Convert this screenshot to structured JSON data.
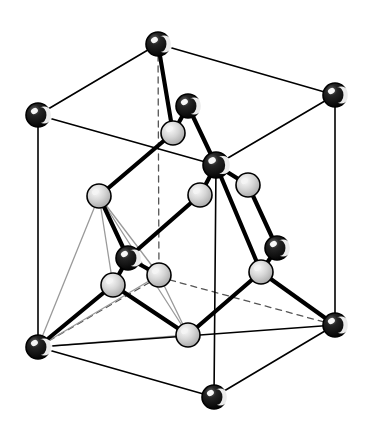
{
  "figure": {
    "background_color": "#ffffff",
    "width": 368,
    "height": 424
  },
  "style": {
    "cell_edge_color": "#000000",
    "cell_edge_width": 1.6,
    "hidden_edge_color": "#555555",
    "hidden_edge_width": 1.3,
    "hidden_edge_dash": "6 5",
    "bond_color": "#000000",
    "bond_width": 4.2,
    "thin_bond_color": "#9a9a9a",
    "thin_bond_width": 1.3,
    "atom_dark_fill": "#0a0a0a",
    "atom_dark_highlight": "#ffffff",
    "atom_light_fill": "#c9c9c9",
    "atom_light_highlight": "#f4f4f4",
    "atom_outline": "#000000",
    "atom_outline_width": 1.6
  },
  "cell_vertices": {
    "top_back": {
      "id": "A",
      "x": 158,
      "y": 44
    },
    "top_left": {
      "id": "B",
      "x": 38,
      "y": 115
    },
    "top_right": {
      "id": "C",
      "x": 335,
      "y": 95
    },
    "top_front": {
      "id": "D",
      "x": 216,
      "y": 165
    },
    "bot_back": {
      "id": "E",
      "x": 159,
      "y": 277
    },
    "bot_left": {
      "id": "F",
      "x": 38,
      "y": 347
    },
    "bot_right": {
      "id": "G",
      "x": 335,
      "y": 325
    },
    "bot_front": {
      "id": "H",
      "x": 214,
      "y": 397
    }
  },
  "cell_edges_visible": [
    {
      "name": "top-back-to-top-left",
      "from": "top_back",
      "to": "top_left"
    },
    {
      "name": "top-back-to-top-right",
      "from": "top_back",
      "to": "top_right"
    },
    {
      "name": "top-left-to-top-front",
      "from": "top_left",
      "to": "top_front"
    },
    {
      "name": "top-right-to-top-front",
      "from": "top_right",
      "to": "top_front"
    },
    {
      "name": "top-left-to-bot-left",
      "from": "top_left",
      "to": "bot_left"
    },
    {
      "name": "top-right-to-bot-right",
      "from": "top_right",
      "to": "bot_right"
    },
    {
      "name": "top-front-to-bot-front",
      "from": "top_front",
      "to": "bot_front"
    },
    {
      "name": "bot-left-to-bot-front",
      "from": "bot_left",
      "to": "bot_front"
    },
    {
      "name": "bot-right-to-bot-front",
      "from": "bot_right",
      "to": "bot_front"
    },
    {
      "name": "bot-left-to-bot-right-front-diag",
      "from": "bot_left",
      "to": "bot_right"
    }
  ],
  "cell_edges_hidden": [
    {
      "name": "top-back-to-bot-back",
      "from": "top_back",
      "to": "bot_back"
    },
    {
      "name": "bot-back-to-bot-left",
      "from": "bot_back",
      "to": "bot_left"
    },
    {
      "name": "bot-back-to-bot-right",
      "from": "bot_back",
      "to": "bot_right"
    }
  ],
  "atoms": [
    {
      "id": "a1",
      "name": "corner-atom-top-back",
      "type": "dark",
      "x": 158,
      "y": 44,
      "r": 12
    },
    {
      "id": "a2",
      "name": "corner-atom-top-left",
      "type": "dark",
      "x": 38,
      "y": 115,
      "r": 12
    },
    {
      "id": "a3",
      "name": "corner-atom-top-right",
      "type": "dark",
      "x": 335,
      "y": 95,
      "r": 12
    },
    {
      "id": "a4",
      "name": "corner-atom-top-front",
      "type": "dark",
      "x": 216,
      "y": 165,
      "r": 13
    },
    {
      "id": "a5",
      "name": "corner-atom-bot-left",
      "type": "dark",
      "x": 38,
      "y": 347,
      "r": 12
    },
    {
      "id": "a6",
      "name": "corner-atom-bot-right",
      "type": "dark",
      "x": 335,
      "y": 325,
      "r": 12
    },
    {
      "id": "a7",
      "name": "corner-atom-bot-front",
      "type": "dark",
      "x": 214,
      "y": 397,
      "r": 12
    },
    {
      "id": "a8",
      "name": "interior-dark-atom-upper",
      "type": "dark",
      "x": 188,
      "y": 106,
      "r": 12
    },
    {
      "id": "a9",
      "name": "interior-dark-atom-left",
      "type": "dark",
      "x": 128,
      "y": 258,
      "r": 12
    },
    {
      "id": "a10",
      "name": "interior-dark-atom-right",
      "type": "dark",
      "x": 277,
      "y": 248,
      "r": 12
    },
    {
      "id": "b1",
      "name": "interior-light-atom-top",
      "type": "light",
      "x": 173,
      "y": 133,
      "r": 12
    },
    {
      "id": "b2",
      "name": "interior-light-atom-left",
      "type": "light",
      "x": 99,
      "y": 196,
      "r": 12
    },
    {
      "id": "b3",
      "name": "interior-light-atom-center",
      "type": "light",
      "x": 200,
      "y": 195,
      "r": 12
    },
    {
      "id": "b4",
      "name": "interior-light-atom-upright",
      "type": "light",
      "x": 248,
      "y": 185,
      "r": 12
    },
    {
      "id": "b5",
      "name": "interior-light-atom-back",
      "type": "light",
      "x": 159,
      "y": 275,
      "r": 12
    },
    {
      "id": "b6",
      "name": "interior-light-atom-lowleft",
      "type": "light",
      "x": 113,
      "y": 285,
      "r": 12
    },
    {
      "id": "b7",
      "name": "interior-light-atom-lowright",
      "type": "light",
      "x": 261,
      "y": 272,
      "r": 12
    },
    {
      "id": "b8",
      "name": "interior-light-atom-bottom",
      "type": "light",
      "x": 188,
      "y": 335,
      "r": 12
    }
  ],
  "bonds": [
    {
      "name": "bond-a1-b1",
      "from": "a1",
      "to": "b1"
    },
    {
      "name": "bond-a8-b1",
      "from": "a8",
      "to": "b1"
    },
    {
      "name": "bond-a8-a4",
      "from": "a8",
      "to": "a4"
    },
    {
      "name": "bond-b1-b2-via-left",
      "from": "b1",
      "to": "b2"
    },
    {
      "name": "bond-a4-b3",
      "from": "a4",
      "to": "b3"
    },
    {
      "name": "bond-a4-b4",
      "from": "a4",
      "to": "b4"
    },
    {
      "name": "bond-a4-b7",
      "from": "a4",
      "to": "b7"
    },
    {
      "name": "bond-b4-a10",
      "from": "b4",
      "to": "a10"
    },
    {
      "name": "bond-a10-b7",
      "from": "a10",
      "to": "b7"
    },
    {
      "name": "bond-b7-a6",
      "from": "b7",
      "to": "a6"
    },
    {
      "name": "bond-b7-b8",
      "from": "b7",
      "to": "b8"
    },
    {
      "name": "bond-b3-a9",
      "from": "b3",
      "to": "a9"
    },
    {
      "name": "bond-b2-a9",
      "from": "b2",
      "to": "a9"
    },
    {
      "name": "bond-a9-b6",
      "from": "a9",
      "to": "b6"
    },
    {
      "name": "bond-a9-b5",
      "from": "a9",
      "to": "b5"
    },
    {
      "name": "bond-b6-b8",
      "from": "b6",
      "to": "b8"
    },
    {
      "name": "bond-b6-a5",
      "from": "b6",
      "to": "a5"
    }
  ],
  "thin_bonds": [
    {
      "name": "thin-b2-a5",
      "from": "b2",
      "to": "a5"
    },
    {
      "name": "thin-b2-b6",
      "from": "b2",
      "to": "b6"
    },
    {
      "name": "thin-b2-b5",
      "from": "b2",
      "to": "b5"
    },
    {
      "name": "thin-b2-b8",
      "from": "b2",
      "to": "b8"
    },
    {
      "name": "thin-a5-b5",
      "from": "a5",
      "to": "b5"
    },
    {
      "name": "thin-a5-b8",
      "from": "a5",
      "to": "b8"
    },
    {
      "name": "thin-b5-b8",
      "from": "b5",
      "to": "b8"
    }
  ],
  "legend": {
    "dark_atom_label": "dark sphere (cation site)",
    "light_atom_label": "light sphere (anion site)"
  }
}
